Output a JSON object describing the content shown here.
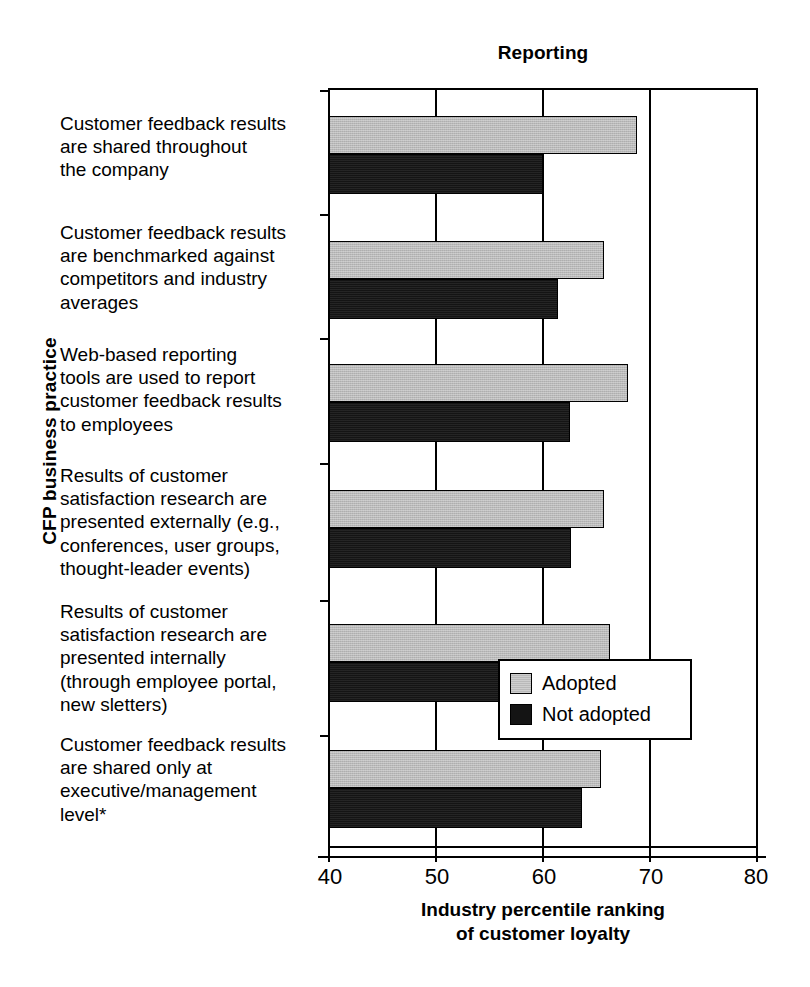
{
  "chart_data": {
    "type": "bar",
    "orientation": "horizontal",
    "title": "Reporting",
    "xlabel": "Industry percentile ranking\nof customer loyalty",
    "xlabel_line1": "Industry percentile ranking",
    "xlabel_line2": "of customer loyalty",
    "ylabel": "CFP business practice",
    "xlim": [
      40,
      80
    ],
    "xticks": [
      40,
      50,
      60,
      70,
      80
    ],
    "xticklabels": [
      "40",
      "50",
      "60",
      "70",
      "80"
    ],
    "grid": true,
    "grid_axis": "x",
    "legend_position": "center right",
    "categories": [
      "Customer feedback results are shared throughout the company",
      "Customer feedback results are benchmarked against competitors and industry averages",
      "Web-based reporting tools are used to report customer feedback results to employees",
      "Results of customer satisfaction research are presented externally (e.g., conferences, user groups, thought-leader events)",
      "Results of customer satisfaction research are presented internally (through employee portal, new sletters)",
      "Customer feedback results are shared only at executive/management level*"
    ],
    "category_lines": [
      [
        "Customer feedback results",
        "are shared throughout",
        "the company"
      ],
      [
        "Customer feedback results",
        "are benchmarked against",
        "competitors and industry",
        "averages"
      ],
      [
        "Web-based reporting",
        "tools are used to report",
        "customer feedback results",
        "to employees"
      ],
      [
        "Results of customer",
        "satisfaction research are",
        "presented externally (e.g.,",
        "conferences, user groups,",
        "thought-leader events)"
      ],
      [
        "Results of customer",
        "satisfaction research are",
        "presented internally",
        "(through employee portal,",
        "new sletters)"
      ],
      [
        "Customer feedback results",
        "are shared only at",
        "executive/management",
        "level*"
      ]
    ],
    "series": [
      {
        "name": "Adopted",
        "color": "#b9b9b9",
        "values": [
          68.8,
          65.7,
          68.0,
          65.7,
          66.3,
          65.4
        ]
      },
      {
        "name": "Not adopted",
        "color": "#141414",
        "values": [
          60.0,
          61.4,
          62.5,
          62.6,
          64.0,
          63.7
        ]
      }
    ],
    "legend": [
      "Adopted",
      "Not adopted"
    ]
  },
  "legend": {
    "adopted_label": "Adopted",
    "not_adopted_label": "Not adopted"
  }
}
